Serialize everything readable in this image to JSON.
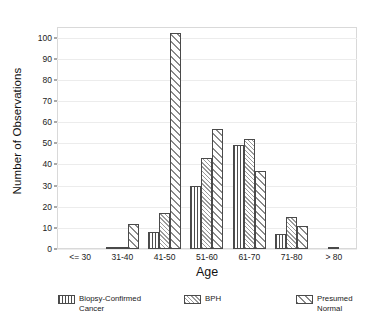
{
  "chart_data": {
    "type": "bar",
    "title": "",
    "xlabel": "Age",
    "ylabel": "Number of Observations",
    "categories": [
      "<= 30",
      "31-40",
      "41-50",
      "51-60",
      "61-70",
      "71-80",
      "> 80"
    ],
    "series": [
      {
        "name": "Biopsy-Confirmed Cancer",
        "values": [
          0,
          1,
          8,
          30,
          49,
          7,
          0
        ]
      },
      {
        "name": "BPH",
        "values": [
          0,
          1,
          17,
          43,
          52,
          15,
          1
        ]
      },
      {
        "name": "Presumed Normal",
        "values": [
          0,
          12,
          102,
          57,
          37,
          11,
          0
        ]
      }
    ],
    "ylim": [
      0,
      105
    ],
    "yticks": [
      0,
      10,
      20,
      30,
      40,
      50,
      60,
      70,
      80,
      90,
      100
    ],
    "grid": true,
    "legend_position": "bottom"
  },
  "legend": {
    "items": [
      {
        "label": "Biopsy-Confirmed\nCancer",
        "pattern": "vertical-hatch"
      },
      {
        "label": "BPH",
        "pattern": "fine-diagonal-hatch"
      },
      {
        "label": "Presumed\nNormal",
        "pattern": "coarse-diagonal-hatch"
      }
    ]
  }
}
